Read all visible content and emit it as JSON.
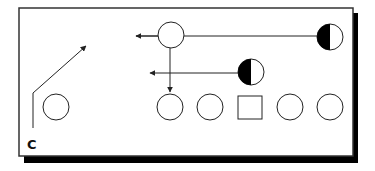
{
  "diagram": {
    "type": "play-diagram",
    "frame": {
      "x": 19,
      "y": 8,
      "width": 334,
      "height": 148,
      "border_color": "#333333",
      "shadow_color": "#000000"
    },
    "label": {
      "text": "C",
      "x": 28,
      "y": 148
    },
    "players": [
      {
        "id": "top-player",
        "shape": "circle",
        "cx": 171,
        "cy": 35,
        "r": 13,
        "fill": "none"
      },
      {
        "id": "left-player",
        "shape": "circle",
        "cx": 56,
        "cy": 107,
        "r": 13,
        "fill": "none"
      },
      {
        "id": "line-1",
        "shape": "circle",
        "cx": 170,
        "cy": 107,
        "r": 13,
        "fill": "none"
      },
      {
        "id": "line-2",
        "shape": "circle",
        "cx": 210,
        "cy": 107,
        "r": 13,
        "fill": "none"
      },
      {
        "id": "center",
        "shape": "square",
        "x": 238,
        "y": 97,
        "size": 24
      },
      {
        "id": "line-4",
        "shape": "circle",
        "cx": 290,
        "cy": 107,
        "r": 13,
        "fill": "none"
      },
      {
        "id": "line-5",
        "shape": "circle",
        "cx": 330,
        "cy": 107,
        "r": 13,
        "fill": "none"
      },
      {
        "id": "defender-1",
        "shape": "half-circle",
        "cx": 330,
        "cy": 37,
        "r": 13,
        "filled_side": "left"
      },
      {
        "id": "defender-2",
        "shape": "half-circle",
        "cx": 251,
        "cy": 72,
        "r": 13,
        "filled_side": "left"
      }
    ],
    "routes": [
      {
        "id": "route-defender-1",
        "points": [
          [
            317,
            36
          ],
          [
            136,
            36
          ]
        ],
        "arrow": true
      },
      {
        "id": "route-defender-2",
        "points": [
          [
            238,
            73
          ],
          [
            150,
            73
          ]
        ],
        "arrow": true
      },
      {
        "id": "route-top-player",
        "points": [
          [
            170,
            48
          ],
          [
            170,
            92
          ]
        ],
        "arrow": true
      },
      {
        "id": "route-c",
        "points": [
          [
            33,
            128
          ],
          [
            33,
            93
          ],
          [
            86,
            46
          ]
        ],
        "arrow": true
      }
    ]
  }
}
